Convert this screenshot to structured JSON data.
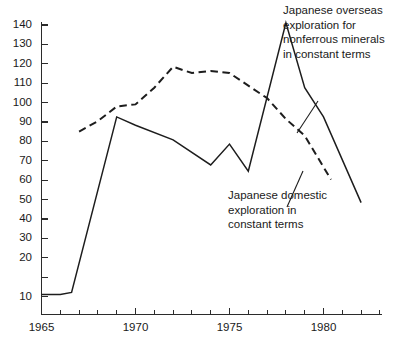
{
  "chart_data": {
    "type": "line",
    "title": "",
    "subtitle": "",
    "xlabel": "",
    "ylabel": "",
    "xlim": [
      1965,
      1982.2
    ],
    "ylim": [
      0,
      145
    ],
    "grid": false,
    "legend_position": "inline-annotations",
    "y_ticks": [
      10,
      20,
      30,
      40,
      50,
      60,
      70,
      80,
      90,
      100,
      110,
      120,
      130,
      140
    ],
    "y_tick_labels": [
      "10",
      "20",
      "30",
      "40",
      "50",
      "60",
      "70",
      "80",
      "90",
      "100",
      "110",
      "120",
      "130",
      "140"
    ],
    "x_ticks": [
      1965,
      1966,
      1967,
      1968,
      1969,
      1970,
      1971,
      1972,
      1973,
      1974,
      1975,
      1976,
      1977,
      1978,
      1979,
      1980,
      1981,
      1982
    ],
    "x_tick_labels_shown": [
      "1965",
      "1970",
      "1975",
      "1980"
    ],
    "x_labeled_values": [
      1965,
      1970,
      1975,
      1980
    ],
    "series": [
      {
        "name": "Japanese overseas exploration for nonferrous minerals in constant terms",
        "style": "solid",
        "color": "#1d1d1d",
        "x": [
          1965,
          1966,
          1966.6,
          1969,
          1970,
          1972,
          1974,
          1975,
          1976,
          1978,
          1979,
          1980,
          1982
        ],
        "values": [
          11,
          11,
          12,
          96,
          92,
          85,
          73,
          83,
          70,
          141,
          110,
          96,
          55
        ]
      },
      {
        "name": "Japanese domestic exploration in constant terms",
        "style": "dashed",
        "color": "#1d1d1d",
        "x": [
          1967,
          1968,
          1969,
          1970,
          1971,
          1972,
          1973,
          1974,
          1975,
          1976,
          1977,
          1978,
          1979,
          1980.4
        ],
        "values": [
          89,
          94,
          101,
          102,
          110,
          120,
          117,
          118,
          117,
          111,
          105,
          95,
          87,
          66
        ]
      }
    ],
    "annotations": [
      {
        "id": "overseas-annotation",
        "lines": [
          "Japanese overseas",
          "exploration for",
          "nonferrous minerals",
          "in constant terms"
        ],
        "target_series": "Japanese overseas exploration for nonferrous minerals in constant terms"
      },
      {
        "id": "domestic-annotation",
        "lines": [
          "Japanese domestic",
          "exploration in",
          "constant terms"
        ],
        "target_series": "Japanese domestic exploration in constant terms"
      }
    ]
  },
  "axes": {
    "y_labels": [
      "140",
      "130",
      "120",
      "110",
      "100",
      "90",
      "80",
      "70",
      "60",
      "50",
      "40",
      "30",
      "20",
      "10"
    ],
    "x_labels": [
      "1965",
      "1970",
      "1975",
      "1980"
    ]
  },
  "annotations": {
    "overseas": {
      "line1": "Japanese overseas",
      "line2": "exploration for",
      "line3": "nonferrous minerals",
      "line4": "in constant terms"
    },
    "domestic": {
      "line1": "Japanese domestic",
      "line2": "exploration in",
      "line3": "constant terms"
    }
  }
}
